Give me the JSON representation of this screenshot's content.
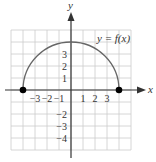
{
  "chart_data": {
    "type": "line",
    "title": "",
    "xlabel": "x",
    "ylabel": "y",
    "curve_label": "y = f(x)",
    "function": "f(x) = sqrt(16 - x^2)",
    "domain": [
      -4,
      4
    ],
    "range": [
      0,
      4
    ],
    "x": [
      -4,
      -3,
      -2,
      -1,
      0,
      1,
      2,
      3,
      4
    ],
    "y": [
      0,
      2.65,
      3.46,
      3.87,
      4,
      3.87,
      3.46,
      2.65,
      0
    ],
    "endpoints": [
      {
        "x": -4,
        "y": 0,
        "closed": true
      },
      {
        "x": 4,
        "y": 0,
        "closed": true
      }
    ],
    "xlim": [
      -5,
      5
    ],
    "ylim": [
      -5,
      5
    ],
    "grid": true,
    "x_tick_labels": [
      "−3",
      "−2",
      "−1",
      "1",
      "2",
      "3"
    ],
    "x_tick_values": [
      -3,
      -2,
      -1,
      1,
      2,
      3
    ],
    "y_tick_labels": [
      "3",
      "2",
      "1",
      "−2",
      "−3",
      "−4"
    ],
    "y_tick_values": [
      3,
      2,
      1,
      -2,
      -3,
      -4
    ],
    "colors": {
      "curve": "#666666",
      "grid": "#cccccc",
      "axes": "#333333",
      "points": "#000000"
    }
  }
}
